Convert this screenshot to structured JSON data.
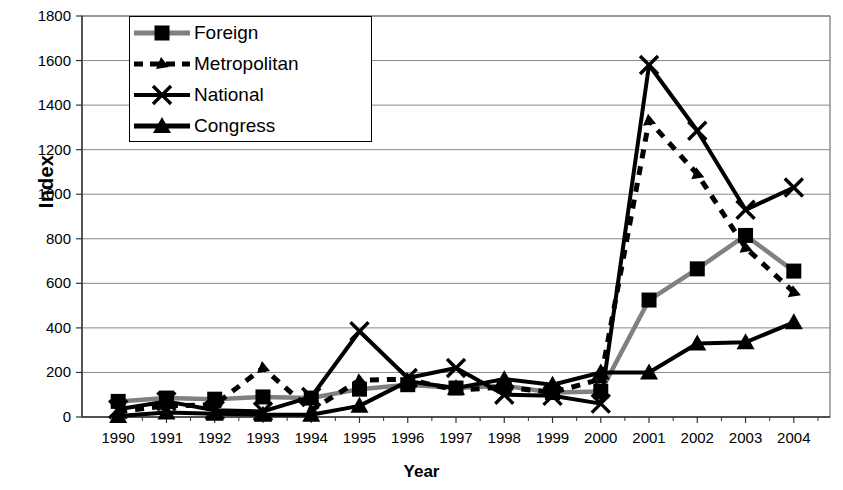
{
  "chart_data": {
    "type": "line",
    "title": "",
    "xlabel": "Year",
    "ylabel": "Index",
    "x": [
      1990,
      1991,
      1992,
      1993,
      1994,
      1995,
      1996,
      1997,
      1998,
      1999,
      2000,
      2001,
      2002,
      2003,
      2004
    ],
    "categories": [
      "1990",
      "1991",
      "1992",
      "1993",
      "1994",
      "1995",
      "1996",
      "1997",
      "1998",
      "1999",
      "2000",
      "2001",
      "2002",
      "2003",
      "2004"
    ],
    "ylim": [
      0,
      1800
    ],
    "yticks": [
      0,
      200,
      400,
      600,
      800,
      1000,
      1200,
      1400,
      1600,
      1800
    ],
    "ytick_labels": [
      "0",
      "200",
      "400",
      "600",
      "800",
      "1000",
      "1200",
      "1400",
      "1600",
      "1800"
    ],
    "grid": true,
    "legend_position": "top-left-inside",
    "series": [
      {
        "name": "Foreign",
        "marker": "square",
        "linestyle": "solid",
        "color": "#808080",
        "values": [
          70,
          85,
          80,
          90,
          85,
          125,
          145,
          130,
          140,
          110,
          115,
          525,
          665,
          815,
          655
        ]
      },
      {
        "name": "Metropolitan",
        "marker": "triangle-small",
        "linestyle": "dashed",
        "color": "#000000",
        "values": [
          25,
          50,
          55,
          220,
          30,
          165,
          170,
          120,
          135,
          110,
          170,
          1330,
          1090,
          760,
          560
        ]
      },
      {
        "name": "National",
        "marker": "x",
        "linestyle": "solid",
        "color": "#000000",
        "values": [
          35,
          70,
          30,
          25,
          90,
          385,
          175,
          220,
          100,
          95,
          60,
          1580,
          1285,
          930,
          1030
        ]
      },
      {
        "name": "Congress",
        "marker": "triangle",
        "linestyle": "solid",
        "color": "#000000",
        "values": [
          5,
          20,
          15,
          10,
          10,
          50,
          160,
          130,
          170,
          145,
          200,
          200,
          330,
          335,
          425
        ]
      }
    ]
  },
  "legend": {
    "items": [
      {
        "label": "Foreign"
      },
      {
        "label": "Metropolitan"
      },
      {
        "label": "National"
      },
      {
        "label": "Congress"
      }
    ]
  }
}
